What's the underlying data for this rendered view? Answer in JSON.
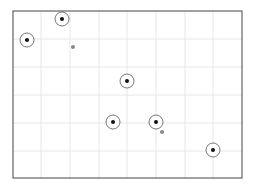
{
  "board": {
    "frame": {
      "left": 13,
      "top": 11,
      "right": 242,
      "bottom": 178
    },
    "grid_x": [
      41,
      70,
      99,
      127,
      156,
      185,
      213
    ],
    "grid_y": [
      39,
      67,
      95,
      123,
      151
    ],
    "colors": {
      "frame": "#444444",
      "grid": "#e6e6e6",
      "ring": "#555555",
      "dot": "#111111",
      "marker": "#888888"
    },
    "targets": [
      {
        "x": 27,
        "y": 40
      },
      {
        "x": 62,
        "y": 19
      },
      {
        "x": 127,
        "y": 81
      },
      {
        "x": 113,
        "y": 122
      },
      {
        "x": 156,
        "y": 122
      },
      {
        "x": 213,
        "y": 150
      }
    ],
    "markers": [
      {
        "x": 73,
        "y": 47
      },
      {
        "x": 162,
        "y": 132
      }
    ]
  }
}
